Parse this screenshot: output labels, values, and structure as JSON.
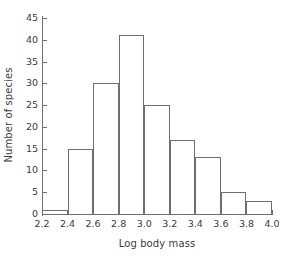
{
  "chart_data": {
    "type": "bar",
    "title": "",
    "xlabel": "Log body mass",
    "ylabel": "Number of species",
    "bin_edges": [
      2.2,
      2.4,
      2.6,
      2.8,
      3.0,
      3.2,
      3.4,
      3.6,
      3.8,
      4.0
    ],
    "categories": [
      "2.2-2.4",
      "2.4-2.6",
      "2.6-2.8",
      "2.8-3.0",
      "3.0-3.2",
      "3.2-3.4",
      "3.4-3.6",
      "3.6-3.8",
      "3.8-4.0"
    ],
    "values": [
      1,
      15,
      30,
      41,
      25,
      17,
      13,
      5,
      3
    ],
    "xlim": [
      2.2,
      4.0
    ],
    "ylim": [
      0,
      45
    ],
    "xticks": [
      "2.2",
      "2.4",
      "2.6",
      "2.8",
      "3.0",
      "3.2",
      "3.4",
      "3.6",
      "3.8",
      "4.0"
    ],
    "yticks": [
      "0",
      "5",
      "10",
      "15",
      "20",
      "25",
      "30",
      "35",
      "40",
      "45"
    ],
    "grid": false,
    "legend": null,
    "bar_fill": "#ffffff",
    "bar_edge": "#6f6f6f",
    "axis_color": "#6f6f6f",
    "text_color": "#3a3a3a"
  }
}
